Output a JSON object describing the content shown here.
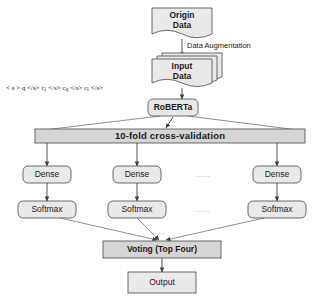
{
  "diagram": {
    "colors": {
      "node_fill": "#e9e9e9",
      "bar_fill": "#d5d5d5",
      "stroke": "#5a5a5a",
      "text": "#1a1a1a",
      "ellipsis": "#9a9a9a",
      "background": "#ffffff"
    },
    "nodes": {
      "origin_data": {
        "line1": "Origin",
        "line2": "Data",
        "shape": "document"
      },
      "input_data": {
        "line1": "Input",
        "line2": "Data",
        "shape": "stacked-document"
      },
      "roberta": {
        "label": "RoBERTa",
        "shape": "rounded-rect"
      },
      "cross_validation": {
        "label": "10-fold cross-validation",
        "shape": "bar"
      },
      "voting": {
        "label": "Voting (Top Four)",
        "shape": "bar"
      },
      "output": {
        "label": "Output",
        "shape": "rect"
      }
    },
    "dense_layer": {
      "label": "Dense",
      "count_shown": 3,
      "boxes": [
        {
          "label": "Dense"
        },
        {
          "label": "Dense"
        },
        {
          "label": "Dense"
        }
      ],
      "ellipsis": "......"
    },
    "softmax_layer": {
      "label": "Softmax",
      "count_shown": 3,
      "boxes": [
        {
          "label": "Softmax"
        },
        {
          "label": "Softmax"
        },
        {
          "label": "Softmax"
        }
      ],
      "ellipsis": "......"
    },
    "edge_labels": {
      "data_augmentation": "Data Augmentation"
    },
    "token_sequence": {
      "parts": [
        {
          "text": "< s > q </s> r"
        },
        {
          "sub": "1"
        },
        {
          "text": " </s> c"
        },
        {
          "sub": "q"
        },
        {
          "text": " </s> c"
        },
        {
          "sub": "i"
        },
        {
          "text": " </s>"
        }
      ],
      "plain": "< s > q </s> r1 </s> cq </s> ci </s>"
    }
  }
}
